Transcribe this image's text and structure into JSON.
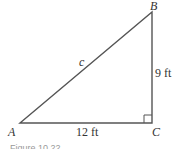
{
  "diagram": {
    "type": "right-triangle",
    "vertices": {
      "A": {
        "label": "A",
        "x": 20,
        "y": 123
      },
      "B": {
        "label": "B",
        "x": 152,
        "y": 12
      },
      "C": {
        "label": "C",
        "x": 152,
        "y": 123
      }
    },
    "sides": {
      "hypotenuse": {
        "label": "c",
        "from": "A",
        "to": "B"
      },
      "vertical": {
        "label": "9 ft",
        "from": "B",
        "to": "C"
      },
      "horizontal": {
        "label": "12 ft",
        "from": "A",
        "to": "C"
      }
    },
    "right_angle_at": "C",
    "stroke_color": "#555555",
    "caption": "Figure 10.22"
  }
}
